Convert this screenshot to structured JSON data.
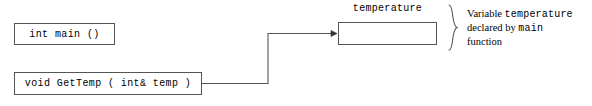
{
  "diagram": {
    "type": "parameter-passing-diagram",
    "line_color": "#555555",
    "text_color": "#000000",
    "background": "#ffffff",
    "boxes": [
      {
        "id": "main",
        "label": "int main ()",
        "style": "code"
      },
      {
        "id": "gettemp",
        "label": "void GetTemp ( int& temp )",
        "style": "code"
      }
    ],
    "variable": {
      "label": "temperature",
      "value": ""
    },
    "annotation": {
      "line1_pre": "Variable ",
      "line1_code": "temperature",
      "line2_pre": "declared by ",
      "line2_code": "main",
      "line3": "function"
    },
    "connector": {
      "from": "gettemp",
      "to": "temperature",
      "arrowhead": "solid"
    }
  }
}
